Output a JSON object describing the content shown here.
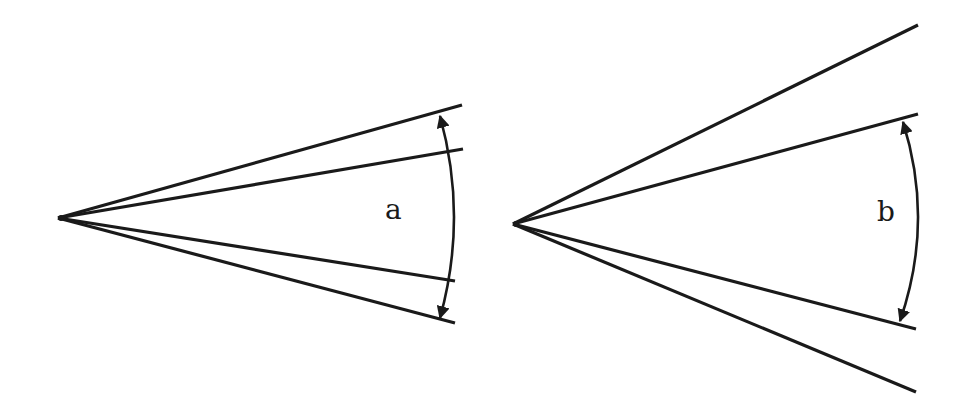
{
  "diagram": {
    "colors": {
      "stroke": "#1a1a1a",
      "background": "#ffffff"
    },
    "panels": [
      {
        "id": "a",
        "label": "a",
        "apex": [
          58,
          218
        ],
        "lines": [
          {
            "role": "outer-upper",
            "end": [
              462,
              105
            ]
          },
          {
            "role": "inner-upper",
            "end": [
              463,
              149
            ]
          },
          {
            "role": "inner-lower",
            "end": [
              455,
              281
            ]
          },
          {
            "role": "outer-lower",
            "end": [
              455,
              323
            ]
          }
        ],
        "arc": {
          "from": [
            440,
            116
          ],
          "to": [
            440,
            318
          ],
          "bulge_x": 454,
          "arrowheads": "both",
          "spans": "outer lines"
        }
      },
      {
        "id": "b",
        "label": "b",
        "apex": [
          513,
          224
        ],
        "lines": [
          {
            "role": "outer-upper",
            "end": [
              918,
              25
            ]
          },
          {
            "role": "inner-upper",
            "end": [
              918,
              114
            ]
          },
          {
            "role": "inner-lower",
            "end": [
              916,
              329
            ]
          },
          {
            "role": "outer-lower",
            "end": [
              916,
              392
            ]
          }
        ],
        "arc": {
          "from": [
            903,
            122
          ],
          "to": [
            900,
            321
          ],
          "bulge_x": 918,
          "arrowheads": "both",
          "spans": "inner lines"
        }
      }
    ]
  }
}
